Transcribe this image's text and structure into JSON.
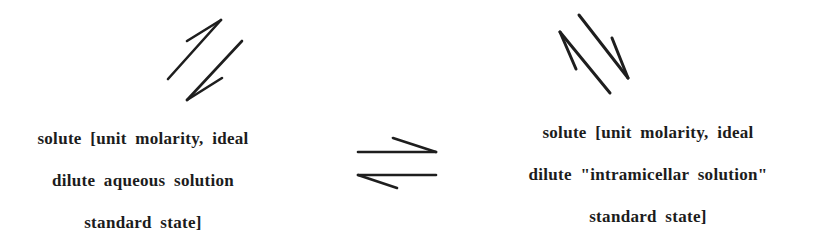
{
  "diagram": {
    "type": "equilibrium-scheme",
    "left_state": {
      "lines": [
        "solute [unit molarity, ideal",
        "dilute aqueous solution",
        "standard state]"
      ]
    },
    "right_state": {
      "lines": [
        "solute [unit molarity, ideal",
        "dilute \"intramicellar solution\"",
        "standard state]"
      ]
    },
    "center_arrow": {
      "icon": "equilibrium-harpoons-icon",
      "direction": "left-right reversible"
    },
    "left_arrow": {
      "icon": "diagonal-equilibrium-arrows-icon",
      "direction": "up-right / down-left reversible"
    },
    "right_arrow": {
      "icon": "diagonal-equilibrium-arrows-icon",
      "direction": "up-left / down-right reversible"
    },
    "colors": {
      "ink": "#1e1e1e",
      "background": "#ffffff"
    }
  }
}
